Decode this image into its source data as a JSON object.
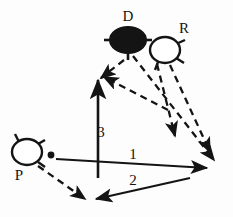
{
  "figure": {
    "kind": "schematic-diagram",
    "background_color": "#fdfdfd",
    "stroke_color": "#141414",
    "width": 233,
    "height": 217
  },
  "nodes": [
    {
      "id": "D",
      "label": "D",
      "style": "filled-ellipse",
      "fill": "#141414",
      "label_position": "above",
      "cx": 128,
      "cy": 40,
      "rx": 18,
      "ry": 13
    },
    {
      "id": "R",
      "label": "R",
      "style": "outline-ellipse",
      "fill": "#ffffff",
      "label_position": "upper-right",
      "cx": 165,
      "cy": 50,
      "rx": 15,
      "ry": 13
    },
    {
      "id": "P",
      "label": "P",
      "style": "outline-ellipse",
      "fill": "#ffffff",
      "label_position": "below-left",
      "cx": 27,
      "cy": 152,
      "rx": 15,
      "ry": 13
    }
  ],
  "point_marker": {
    "name": "origin-dot",
    "cx": 51,
    "cy": 155,
    "r": 3.2,
    "fill": "#141414"
  },
  "vectors": [
    {
      "id": "v1",
      "label": "1",
      "style": "solid",
      "heads": "single",
      "label_x": 133,
      "label_y": 159
    },
    {
      "id": "v2",
      "label": "2",
      "style": "solid",
      "heads": "double",
      "label_x": 133,
      "label_y": 185
    },
    {
      "id": "v3",
      "label": "3",
      "style": "solid",
      "heads": "single",
      "label_x": 101,
      "label_y": 136
    }
  ],
  "dashed_rays": [
    {
      "id": "d-up-left",
      "from": "D",
      "direction": "up-left",
      "arrow": true
    },
    {
      "id": "d-down-right",
      "from": "D",
      "direction": "down-right",
      "arrow": true
    },
    {
      "id": "r-down-right-mid",
      "from": "R",
      "direction": "down-right",
      "arrow": true
    },
    {
      "id": "r-down-right-far",
      "from": "R",
      "direction": "down-right",
      "arrow": true
    },
    {
      "id": "p-down-right",
      "from": "P",
      "direction": "down-right",
      "arrow": true
    }
  ]
}
